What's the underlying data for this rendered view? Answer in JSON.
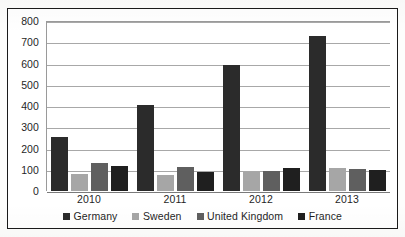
{
  "chart_data": {
    "type": "bar",
    "title": "",
    "subtitle": "",
    "xlabel": "",
    "ylabel": "",
    "categories": [
      "2010",
      "2011",
      "2012",
      "2013"
    ],
    "series": [
      {
        "name": "Germany",
        "color": "#2b2b2b",
        "values": [
          255,
          405,
          595,
          730
        ]
      },
      {
        "name": "Sweden",
        "color": "#a6a6a6",
        "values": [
          80,
          75,
          90,
          110
        ]
      },
      {
        "name": "United Kingdom",
        "color": "#5f5f5f",
        "values": [
          130,
          115,
          95,
          105
        ]
      },
      {
        "name": "France",
        "color": "#1f1f1f",
        "values": [
          120,
          90,
          110,
          100
        ]
      }
    ],
    "ylim": [
      0,
      800
    ],
    "ytick_step": 100,
    "yticks": [
      "800",
      "700",
      "600",
      "500",
      "400",
      "300",
      "200",
      "100",
      "0"
    ],
    "grid": true,
    "grid_axis": "y",
    "legend_position": "bottom",
    "bar_mode": "grouped"
  },
  "axes": {
    "y": {
      "ticks": [
        {
          "label": "800",
          "value": 800
        },
        {
          "label": "700",
          "value": 700
        },
        {
          "label": "600",
          "value": 600
        },
        {
          "label": "500",
          "value": 500
        },
        {
          "label": "400",
          "value": 400
        },
        {
          "label": "300",
          "value": 300
        },
        {
          "label": "200",
          "value": 200
        },
        {
          "label": "100",
          "value": 100
        },
        {
          "label": "0",
          "value": 0
        }
      ]
    },
    "x": {
      "labels": [
        "2010",
        "2011",
        "2012",
        "2013"
      ]
    }
  },
  "legend": {
    "items": [
      {
        "label": "Germany",
        "color": "#2b2b2b"
      },
      {
        "label": "Sweden",
        "color": "#a6a6a6"
      },
      {
        "label": "United Kingdom",
        "color": "#5f5f5f"
      },
      {
        "label": "France",
        "color": "#1f1f1f"
      }
    ]
  },
  "colors": {
    "frame_border": "#1a1a1a",
    "gridline": "#a8a8a8",
    "axis_line": "#9a9a9a",
    "plot_background": "#ffffff",
    "page_background": "#fdfdfc",
    "text": "#1f1f1f"
  }
}
